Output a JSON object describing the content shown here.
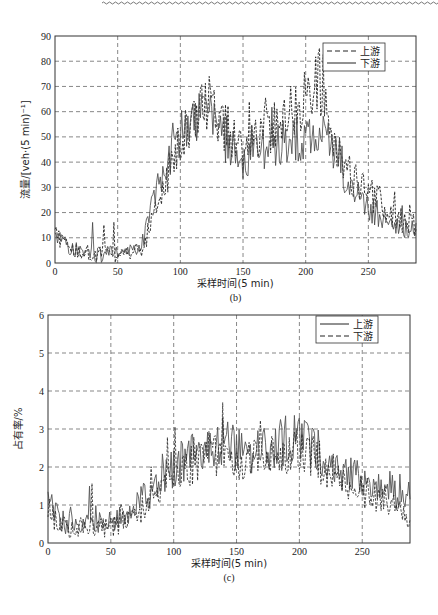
{
  "chart_data": [
    {
      "id": "b",
      "type": "line",
      "caption": "(b)",
      "title": "",
      "xlabel": "采样时间(5 min)",
      "ylabel": "流量/[veh·(5 min)⁻¹]",
      "xlim": [
        0,
        288
      ],
      "ylim": [
        0,
        90
      ],
      "xticks": [
        0,
        50,
        100,
        150,
        200,
        250
      ],
      "yticks": [
        0,
        10,
        20,
        30,
        40,
        50,
        60,
        70,
        80,
        90
      ],
      "grid": true,
      "legend_position": "upper right",
      "series": [
        {
          "name": "上游",
          "style": "dashed",
          "color": "#222222",
          "profile_x": [
            0,
            10,
            30,
            55,
            70,
            80,
            95,
            110,
            120,
            135,
            150,
            165,
            180,
            200,
            210,
            220,
            235,
            250,
            270,
            288
          ],
          "profile_y": [
            12,
            6,
            4,
            3,
            6,
            20,
            42,
            55,
            62,
            55,
            45,
            50,
            58,
            65,
            75,
            50,
            35,
            28,
            18,
            15
          ]
        },
        {
          "name": "下游",
          "style": "solid",
          "color": "#444444",
          "profile_x": [
            0,
            10,
            30,
            55,
            70,
            80,
            95,
            110,
            120,
            135,
            150,
            165,
            180,
            200,
            210,
            220,
            235,
            250,
            270,
            288
          ],
          "profile_y": [
            12,
            6,
            3,
            4,
            8,
            25,
            48,
            58,
            60,
            50,
            40,
            45,
            48,
            50,
            52,
            45,
            30,
            22,
            15,
            12
          ]
        }
      ]
    },
    {
      "id": "c",
      "type": "line",
      "caption": "(c)",
      "title": "",
      "xlabel": "采样时间(5 min)",
      "ylabel": "占有率/%",
      "xlim": [
        0,
        288
      ],
      "ylim": [
        0,
        6
      ],
      "xticks": [
        0,
        50,
        100,
        150,
        200,
        250
      ],
      "yticks": [
        0,
        1,
        2,
        3,
        4,
        5,
        6
      ],
      "grid": true,
      "legend_position": "upper right",
      "series": [
        {
          "name": "上游",
          "style": "solid",
          "color": "#555555",
          "profile_x": [
            0,
            5,
            15,
            40,
            60,
            80,
            100,
            120,
            140,
            160,
            180,
            200,
            220,
            240,
            260,
            288
          ],
          "profile_y": [
            1.6,
            0.8,
            0.5,
            0.5,
            0.7,
            1.3,
            2.0,
            2.4,
            2.6,
            2.4,
            2.6,
            2.8,
            2.3,
            1.8,
            1.6,
            1.0
          ]
        },
        {
          "name": "下游",
          "style": "dashed",
          "color": "#222222",
          "profile_x": [
            0,
            5,
            15,
            40,
            60,
            80,
            100,
            120,
            140,
            160,
            180,
            200,
            220,
            240,
            260,
            288
          ],
          "profile_y": [
            1.0,
            0.6,
            0.4,
            0.4,
            0.5,
            1.0,
            1.7,
            2.2,
            2.3,
            2.1,
            2.3,
            2.5,
            2.0,
            1.5,
            1.2,
            0.7
          ]
        }
      ]
    }
  ],
  "figure": {
    "b": {
      "caption": "(b)",
      "xlabel": "采样时间(5 min)",
      "ylabel": "流量/[veh·(5 min)⁻¹]",
      "legend": [
        "上游",
        "下游"
      ]
    },
    "c": {
      "caption": "(c)",
      "xlabel": "采样时间(5 min)",
      "ylabel": "占有率/%",
      "legend": [
        "上游",
        "下游"
      ]
    }
  }
}
